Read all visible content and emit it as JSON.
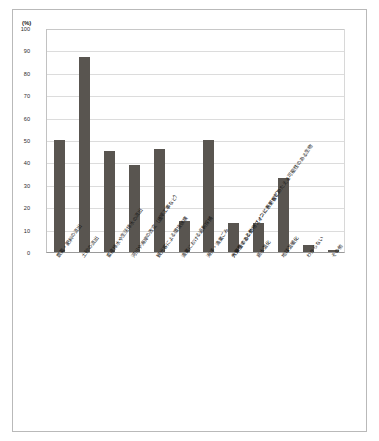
{
  "figure": {
    "unit_label": "(%)",
    "bar_color": "#595550",
    "grid_color": "#dcdcdc",
    "axis_color": "#9a9a9a",
    "frame_color": "#b9b9b9"
  },
  "chart_data": {
    "type": "bar",
    "title": "",
    "xlabel": "",
    "ylabel": "(%)",
    "ylim": [
      0,
      100
    ],
    "yticks": [
      0,
      10,
      20,
      30,
      40,
      50,
      60,
      70,
      80,
      90,
      100
    ],
    "grid": true,
    "legend": "none",
    "categories": [
      "農薬・肥料の流出",
      "土砂の流出",
      "畜産排水や生活排水の流出",
      "河川や海岸の改変（護岸工事など）",
      "観光客による環境破壊",
      "漁業における過剰採捕",
      "海洋・漁業ごみ",
      "外来種のある動物（オニヒトデなど）",
      "高水温化",
      "地球温暖化",
      "わからない",
      "その他"
    ],
    "categories_display": [
      "農薬・肥料の流出",
      "土砂の流出",
      "畜産排水や生活排水の流出",
      "河川や海岸の改変（護岸工事など）",
      "観光客による環境破壊",
      "漁業における過剰採捕",
      "海洋・漁業ごみ",
      "外来種のある動物（オニヒトデなど）",
      "高水温化",
      "地球温暖化",
      "わからない",
      "その他"
    ],
    "values": [
      50,
      87,
      45,
      39,
      46,
      14,
      50,
      13,
      13,
      33,
      3,
      1
    ],
    "annotation_long_label": "大発生するとサーフィンに悪影響をあたえる可能性のある生物"
  },
  "axis": {
    "y_tick_labels": [
      "100",
      "90",
      "80",
      "70",
      "60",
      "50",
      "40",
      "30",
      "20",
      "10",
      "0"
    ]
  }
}
